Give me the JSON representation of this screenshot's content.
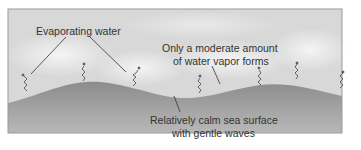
{
  "labels": {
    "evaporating": "Evaporating water",
    "moderate_line1": "Only a moderate amount",
    "moderate_line2": "of water vapor forms",
    "calm_line1": "Relatively calm sea surface",
    "calm_line2": "with gentle waves"
  },
  "colors": {
    "sky": "#dcdcdc",
    "sky_light": "#f0f0f0",
    "sea_top": "#8a8a8a",
    "sea_bottom": "#b5b5b5",
    "frame": "#9a9a9a",
    "text": "#333333"
  },
  "icons": [
    "vapor-squiggle-icon"
  ]
}
